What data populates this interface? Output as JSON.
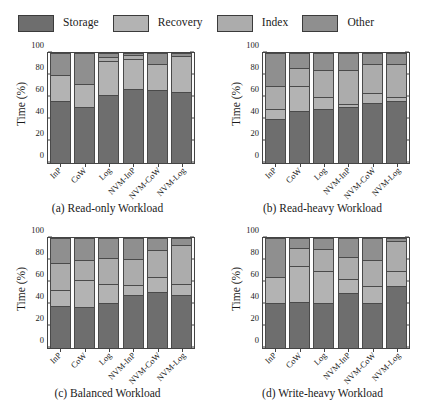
{
  "figure": {
    "legend": {
      "position": "top",
      "entries": [
        {
          "label": "Storage",
          "color": "#6e6e6e"
        },
        {
          "label": "Recovery",
          "color": "#b3b3b3"
        },
        {
          "label": "Index",
          "color": "#acacac"
        },
        {
          "label": "Other",
          "color": "#8f8f8f"
        }
      ]
    }
  },
  "chart_data": [
    {
      "type": "bar",
      "stacked": true,
      "panel": "a",
      "title": "(a) Read-only Workload",
      "xlabel": "",
      "ylabel": "Time (%)",
      "ylim": [
        0,
        100
      ],
      "yticks": [
        0,
        20,
        40,
        60,
        80,
        100
      ],
      "grid": false,
      "categories": [
        "InP",
        "CoW",
        "Log",
        "NVM-InP",
        "NVM-CoW",
        "NVM-Log"
      ],
      "series": [
        {
          "name": "Storage",
          "values": [
            56,
            51,
            62,
            67,
            66,
            65
          ]
        },
        {
          "name": "Recovery",
          "values": [
            24,
            21,
            31,
            28,
            24,
            32
          ]
        },
        {
          "name": "Index",
          "values": [
            0,
            0,
            3,
            3,
            0,
            0
          ]
        },
        {
          "name": "Other",
          "values": [
            20,
            28,
            4,
            2,
            10,
            3
          ]
        }
      ]
    },
    {
      "type": "bar",
      "stacked": true,
      "panel": "b",
      "title": "(b) Read-heavy Workload",
      "xlabel": "",
      "ylabel": "Time (%)",
      "ylim": [
        0,
        100
      ],
      "yticks": [
        0,
        20,
        40,
        60,
        80,
        100
      ],
      "grid": false,
      "categories": [
        "InP",
        "CoW",
        "Log",
        "NVM-InP",
        "NVM-CoW",
        "NVM-Log"
      ],
      "series": [
        {
          "name": "Storage",
          "values": [
            40,
            47,
            49,
            51,
            55,
            56
          ]
        },
        {
          "name": "Recovery",
          "values": [
            9,
            23,
            11,
            3,
            9,
            4
          ]
        },
        {
          "name": "Index",
          "values": [
            21,
            16,
            25,
            31,
            26,
            30
          ]
        },
        {
          "name": "Other",
          "values": [
            30,
            14,
            15,
            15,
            10,
            10
          ]
        }
      ]
    },
    {
      "type": "bar",
      "stacked": true,
      "panel": "c",
      "title": "(c) Balanced Workload",
      "xlabel": "",
      "ylabel": "Time (%)",
      "ylim": [
        0,
        100
      ],
      "yticks": [
        0,
        20,
        40,
        60,
        80,
        100
      ],
      "grid": false,
      "categories": [
        "InP",
        "CoW",
        "Log",
        "NVM-InP",
        "NVM-CoW",
        "NVM-Log"
      ],
      "series": [
        {
          "name": "Storage",
          "values": [
            38,
            37,
            41,
            48,
            51,
            48
          ]
        },
        {
          "name": "Recovery",
          "values": [
            15,
            25,
            17,
            9,
            14,
            10
          ]
        },
        {
          "name": "Index",
          "values": [
            24,
            18,
            24,
            24,
            24,
            36
          ]
        },
        {
          "name": "Other",
          "values": [
            23,
            20,
            18,
            19,
            11,
            6
          ]
        }
      ]
    },
    {
      "type": "bar",
      "stacked": true,
      "panel": "d",
      "title": "(d) Write-heavy Workload",
      "xlabel": "",
      "ylabel": "Time (%)",
      "ylim": [
        0,
        100
      ],
      "yticks": [
        0,
        20,
        40,
        60,
        80,
        100
      ],
      "grid": false,
      "categories": [
        "InP",
        "CoW",
        "Log",
        "NVM-InP",
        "NVM-CoW",
        "NVM-Log"
      ],
      "series": [
        {
          "name": "Storage",
          "values": [
            41,
            42,
            41,
            50,
            41,
            56
          ]
        },
        {
          "name": "Recovery",
          "values": [
            24,
            33,
            29,
            13,
            15,
            14
          ]
        },
        {
          "name": "Index",
          "values": [
            0,
            16,
            20,
            20,
            24,
            27
          ]
        },
        {
          "name": "Other",
          "values": [
            35,
            9,
            10,
            17,
            20,
            3
          ]
        }
      ]
    }
  ]
}
